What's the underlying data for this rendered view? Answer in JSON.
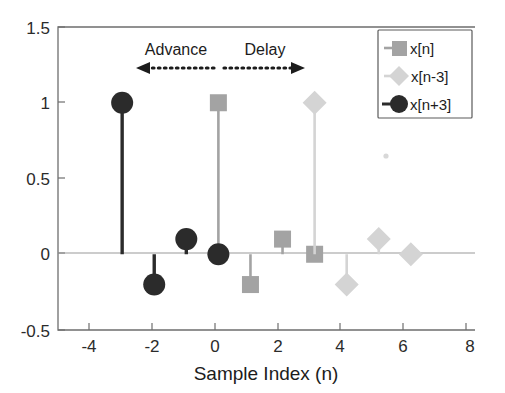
{
  "chart_data": {
    "type": "scatter",
    "title": "",
    "subtitle": "",
    "xlabel": "Sample Index (n)",
    "ylabel": "",
    "xlim": [
      -5,
      8
    ],
    "ylim": [
      -0.5,
      1.5
    ],
    "xticks": [
      -4,
      -2,
      0,
      2,
      4,
      6,
      8
    ],
    "xtick_labels": [
      "-4",
      "-2",
      "0",
      "2",
      "4",
      "6",
      "8"
    ],
    "yticks": [
      -0.5,
      0,
      0.5,
      1,
      1.5
    ],
    "ytick_labels": [
      "-0.5",
      "0",
      "0.5",
      "1",
      "1.5"
    ],
    "grid": false,
    "legend_position": "upper right",
    "plot_style": "stem",
    "series": [
      {
        "name": "x[n]",
        "marker": "square",
        "color": "#a3a3a3",
        "x": [
          0,
          1,
          2,
          3
        ],
        "values": [
          1,
          -0.2,
          0.1,
          0
        ]
      },
      {
        "name": "x[n-3]",
        "marker": "diamond",
        "color": "#d4d4d4",
        "x": [
          3,
          4,
          5,
          6
        ],
        "values": [
          1,
          -0.2,
          0.1,
          0
        ]
      },
      {
        "name": "x[n+3]",
        "marker": "circle",
        "color": "#2b2b2b",
        "x": [
          -3,
          -2,
          -1,
          0
        ],
        "values": [
          1,
          -0.2,
          0.1,
          0
        ]
      }
    ],
    "annotations": [
      {
        "text": "Advance",
        "x": -1.5,
        "y": 1.32,
        "arrow_direction": "left",
        "arrow_x_start": 0,
        "arrow_x_end": -2.5,
        "arrow_y": 1.22
      },
      {
        "text": "Delay",
        "x": 1.4,
        "y": 1.32,
        "arrow_direction": "right",
        "arrow_x_start": 0.2,
        "arrow_x_end": 2.9,
        "arrow_y": 1.22
      }
    ]
  },
  "legend": {
    "entries": [
      {
        "label": "x[n]",
        "marker": "square-marker",
        "color": "#a3a3a3"
      },
      {
        "label": "x[n-3]",
        "marker": "diamond-marker",
        "color": "#d4d4d4"
      },
      {
        "label": "x[n+3]",
        "marker": "circle-marker",
        "color": "#2b2b2b"
      }
    ]
  },
  "axes": {
    "x_title": "Sample Index (n)",
    "x_tick_0": "-4",
    "x_tick_1": "-2",
    "x_tick_2": "0",
    "x_tick_3": "2",
    "x_tick_4": "4",
    "x_tick_5": "6",
    "x_tick_6": "8",
    "y_tick_0": "1.5",
    "y_tick_1": "1",
    "y_tick_2": "0.5",
    "y_tick_3": "0",
    "y_tick_4": "-0.5"
  },
  "annotations": {
    "advance_label": "Advance",
    "delay_label": "Delay"
  }
}
